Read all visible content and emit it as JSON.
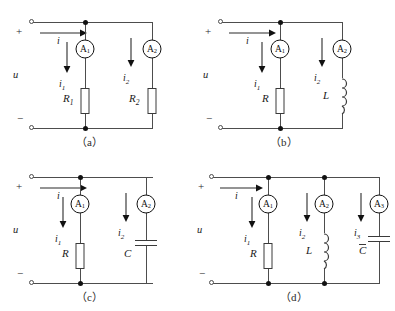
{
  "figure": {
    "background_color": "#ffffff",
    "line_color": "#4d4d4d",
    "ink_color": "#1a1a1a"
  },
  "panels": [
    {
      "id": "a",
      "caption": "（a）",
      "source_voltage_label": "u",
      "polarity_plus": "+",
      "polarity_minus": "−",
      "total_current_label": "i",
      "branches": [
        {
          "meter": "A",
          "meter_index": "1",
          "current_label": "i",
          "current_index": "1",
          "element": "resistor",
          "element_label": "R",
          "element_index": "1"
        },
        {
          "meter": "A",
          "meter_index": "2",
          "current_label": "i",
          "current_index": "2",
          "element": "resistor",
          "element_label": "R",
          "element_index": "2"
        }
      ]
    },
    {
      "id": "b",
      "caption": "（b）",
      "source_voltage_label": "u",
      "polarity_plus": "+",
      "polarity_minus": "−",
      "total_current_label": "i",
      "branches": [
        {
          "meter": "A",
          "meter_index": "1",
          "current_label": "i",
          "current_index": "1",
          "element": "resistor",
          "element_label": "R",
          "element_index": ""
        },
        {
          "meter": "A",
          "meter_index": "2",
          "current_label": "i",
          "current_index": "2",
          "element": "inductor",
          "element_label": "L",
          "element_index": ""
        }
      ]
    },
    {
      "id": "c",
      "caption": "（c）",
      "source_voltage_label": "u",
      "polarity_plus": "+",
      "polarity_minus": "−",
      "total_current_label": "i",
      "branches": [
        {
          "meter": "A",
          "meter_index": "1",
          "current_label": "i",
          "current_index": "1",
          "element": "resistor",
          "element_label": "R",
          "element_index": ""
        },
        {
          "meter": "A",
          "meter_index": "2",
          "current_label": "i",
          "current_index": "2",
          "element": "capacitor",
          "element_label": "C",
          "element_index": ""
        }
      ]
    },
    {
      "id": "d",
      "caption": "（d）",
      "source_voltage_label": "u",
      "polarity_plus": "+",
      "polarity_minus": "−",
      "total_current_label": "i",
      "branches": [
        {
          "meter": "A",
          "meter_index": "1",
          "current_label": "i",
          "current_index": "1",
          "element": "resistor",
          "element_label": "R",
          "element_index": ""
        },
        {
          "meter": "A",
          "meter_index": "2",
          "current_label": "i",
          "current_index": "2",
          "element": "inductor",
          "element_label": "L",
          "element_index": ""
        },
        {
          "meter": "A",
          "meter_index": "3",
          "current_label": "i",
          "current_index": "3",
          "element": "capacitor",
          "element_label": "C",
          "element_index": ""
        }
      ]
    }
  ]
}
